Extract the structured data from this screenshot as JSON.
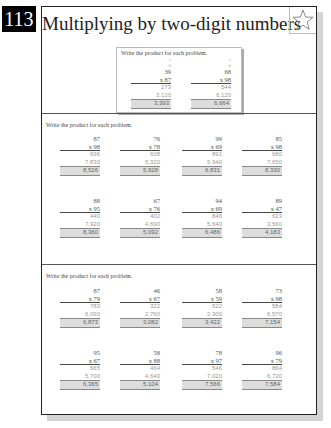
{
  "page": {
    "number": "113",
    "title": "Multiplying by two-digit numbers",
    "star_icon": "star-outline-icon"
  },
  "example": {
    "instruction": "Write the product for each problem.",
    "problems": [
      {
        "carry_top": "7",
        "carry_bottom": "6",
        "top": "39",
        "mult": "x 87",
        "partial1": "273",
        "partial2": "3,120",
        "answer": "3,393"
      },
      {
        "carry_top": "7",
        "carry_bottom": "6",
        "top": "68",
        "mult": "x 98",
        "partial1": "544",
        "partial2": "6,120",
        "answer": "6,664"
      }
    ]
  },
  "sections": [
    {
      "instruction": "Write the product for each problem.",
      "problems": [
        {
          "top": "87",
          "mult": "x 98",
          "partial1": "696",
          "partial2": "7,830",
          "answer": "8,526"
        },
        {
          "top": "76",
          "mult": "x 78",
          "partial1": "608",
          "partial2": "5,320",
          "answer": "5,928"
        },
        {
          "top": "99",
          "mult": "x 69",
          "partial1": "891",
          "partial2": "5,940",
          "answer": "6,831"
        },
        {
          "top": "85",
          "mult": "x 98",
          "partial1": "680",
          "partial2": "7,650",
          "answer": "8,330"
        },
        {
          "top": "88",
          "mult": "x 95",
          "partial1": "440",
          "partial2": "7,920",
          "answer": "8,360"
        },
        {
          "top": "67",
          "mult": "x 76",
          "partial1": "402",
          "partial2": "4,690",
          "answer": "5,092"
        },
        {
          "top": "94",
          "mult": "x 69",
          "partial1": "846",
          "partial2": "5,640",
          "answer": "6,486"
        },
        {
          "top": "89",
          "mult": "x 47",
          "partial1": "623",
          "partial2": "3,560",
          "answer": "4,183"
        }
      ]
    },
    {
      "instruction": "Write the product for each problem.",
      "problems": [
        {
          "top": "87",
          "mult": "x 79",
          "partial1": "783",
          "partial2": "6,090",
          "answer": "6,873"
        },
        {
          "top": "46",
          "mult": "x 67",
          "partial1": "322",
          "partial2": "2,760",
          "answer": "3,082"
        },
        {
          "top": "58",
          "mult": "x 59",
          "partial1": "522",
          "partial2": "2,900",
          "answer": "3,422"
        },
        {
          "top": "73",
          "mult": "x 98",
          "partial1": "584",
          "partial2": "6,570",
          "answer": "7,154"
        },
        {
          "top": "95",
          "mult": "x 67",
          "partial1": "665",
          "partial2": "5,700",
          "answer": "6,365"
        },
        {
          "top": "58",
          "mult": "x 88",
          "partial1": "464",
          "partial2": "4,640",
          "answer": "5,104"
        },
        {
          "top": "78",
          "mult": "x 97",
          "partial1": "546",
          "partial2": "7,020",
          "answer": "7,566"
        },
        {
          "top": "96",
          "mult": "x 79",
          "partial1": "864",
          "partial2": "6,720",
          "answer": "7,584"
        }
      ]
    }
  ]
}
